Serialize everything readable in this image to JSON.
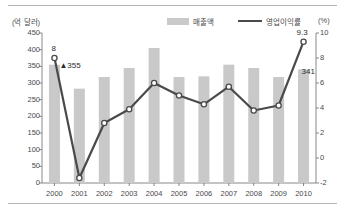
{
  "chart_data": {
    "type": "bar",
    "title": "",
    "subtitle": "",
    "xlabel": "",
    "categories": [
      "2000",
      "2001",
      "2002",
      "2003",
      "2004",
      "2005",
      "2006",
      "2007",
      "2008",
      "2009",
      "2010"
    ],
    "series": [
      {
        "name": "매출액",
        "type": "bar",
        "axis": "left",
        "unit": "억 달러",
        "color": "#c9c9c9",
        "values": [
          355,
          283,
          318,
          345,
          405,
          318,
          320,
          355,
          345,
          318,
          341
        ]
      },
      {
        "name": "영업이익률",
        "type": "line",
        "axis": "right",
        "unit": "%",
        "color": "#4a4a4a",
        "values": [
          8.0,
          -1.6,
          2.8,
          3.9,
          6.0,
          5.0,
          4.3,
          5.7,
          3.8,
          4.2,
          9.3
        ]
      }
    ],
    "left_axis": {
      "label": "(억 달러)",
      "ylim": [
        0,
        450
      ],
      "ticks": [
        450,
        400,
        350,
        300,
        250,
        200,
        150,
        100,
        50,
        0
      ]
    },
    "right_axis": {
      "label": "(%)",
      "ylim": [
        -2,
        10
      ],
      "ticks": [
        10,
        8,
        6,
        4,
        2,
        0,
        -2
      ]
    },
    "grid": false,
    "legend_position": "top-right",
    "annotations": [
      {
        "text": "8",
        "series": "영업이익률",
        "category": "2000"
      },
      {
        "text": "355",
        "series": "매출액",
        "category": "2000",
        "marker": "▲"
      },
      {
        "text": "9.3",
        "series": "영업이익률",
        "category": "2010"
      },
      {
        "text": "341",
        "series": "매출액",
        "category": "2010"
      }
    ]
  },
  "legend": {
    "bar_label": "매출액",
    "line_label": "영업이익률"
  },
  "axes": {
    "left_unit": "(억 달러)",
    "right_unit": "(%)"
  },
  "labels": {
    "first_line_value": "8",
    "first_bar_value": "355",
    "last_line_value": "9.3",
    "last_bar_value": "341",
    "triangle_marker": "▲"
  }
}
